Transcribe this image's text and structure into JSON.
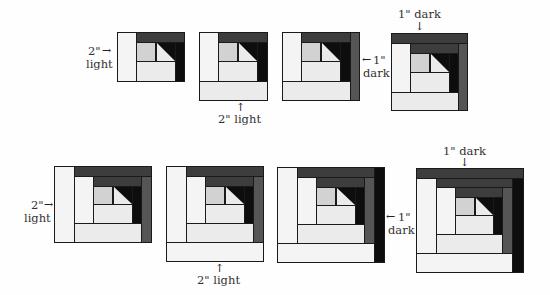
{
  "colors": {
    "light": "#f4f4f4",
    "light_alt": "#ebebeb",
    "medium": "#d2d2d2",
    "dark_1": "#3d3d3d",
    "dark_2": "#555555",
    "black": "#0d0d0d"
  },
  "row1": {
    "step1": {
      "label_line1": "2\"",
      "label_line2": "light",
      "arrow": "→"
    },
    "step2": {
      "label": "2\" light",
      "arrow": "↑"
    },
    "step3": {
      "label_line1": "1\"",
      "label_line2": "dark",
      "arrow": "←"
    },
    "step4": {
      "label": "1\" dark",
      "arrow": "↓"
    }
  },
  "row2": {
    "step1": {
      "label_line1": "2\"",
      "label_line2": "light",
      "arrow": "→"
    },
    "step2": {
      "label": "2\" light",
      "arrow": "↑"
    },
    "step3": {
      "label_line1": "1\"",
      "label_line2": "dark",
      "arrow": "←"
    },
    "step4": {
      "label": "1\" dark",
      "arrow": "↓"
    }
  }
}
